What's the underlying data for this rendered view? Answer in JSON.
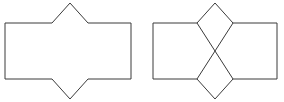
{
  "document": {
    "title": "Two geometric figures",
    "background_color": "#ffffff",
    "stroke_color": "#3a3a3a",
    "stroke_width": 1,
    "width": 284,
    "height": 102
  },
  "figures": [
    {
      "name": "left-figure",
      "label": "notched hexagonal polygon",
      "description": "Rectangle with a triangular point added on the top edge and a matching triangular point added on the bottom edge",
      "outline_points": "5,23 52,23 70,3 88,23 131,23 131,79 88,79 70,99 52,79 5,79",
      "vertices": [
        {
          "x": 5,
          "y": 23
        },
        {
          "x": 52,
          "y": 23
        },
        {
          "x": 70,
          "y": 3
        },
        {
          "x": 88,
          "y": 23
        },
        {
          "x": 131,
          "y": 23
        },
        {
          "x": 131,
          "y": 79
        },
        {
          "x": 88,
          "y": 79
        },
        {
          "x": 70,
          "y": 99
        },
        {
          "x": 52,
          "y": 79
        },
        {
          "x": 5,
          "y": 79
        }
      ]
    },
    {
      "name": "right-figure",
      "label": "notched polygon with crossed diagonals",
      "description": "Same outline as the left figure with two diagonal lines crossing in an X through the centre, joining the four notch corners to the opposite triangle apexes",
      "outline_points": "153,23 197,23 215,3 233,23 277,23 277,79 233,79 215,99 197,79 153,79",
      "vertices": [
        {
          "x": 153,
          "y": 23
        },
        {
          "x": 197,
          "y": 23
        },
        {
          "x": 215,
          "y": 3
        },
        {
          "x": 233,
          "y": 23
        },
        {
          "x": 277,
          "y": 23
        },
        {
          "x": 277,
          "y": 79
        },
        {
          "x": 233,
          "y": 79
        },
        {
          "x": 215,
          "y": 99
        },
        {
          "x": 197,
          "y": 79
        },
        {
          "x": 153,
          "y": 79
        }
      ],
      "diagonals": [
        {
          "name": "diagonal-nw-se",
          "x1": 197,
          "y1": 23,
          "x2": 233,
          "y2": 79
        },
        {
          "name": "diagonal-ne-sw",
          "x1": 233,
          "y1": 23,
          "x2": 197,
          "y2": 79
        }
      ],
      "crossing_point": {
        "x": 215,
        "y": 51
      }
    }
  ]
}
